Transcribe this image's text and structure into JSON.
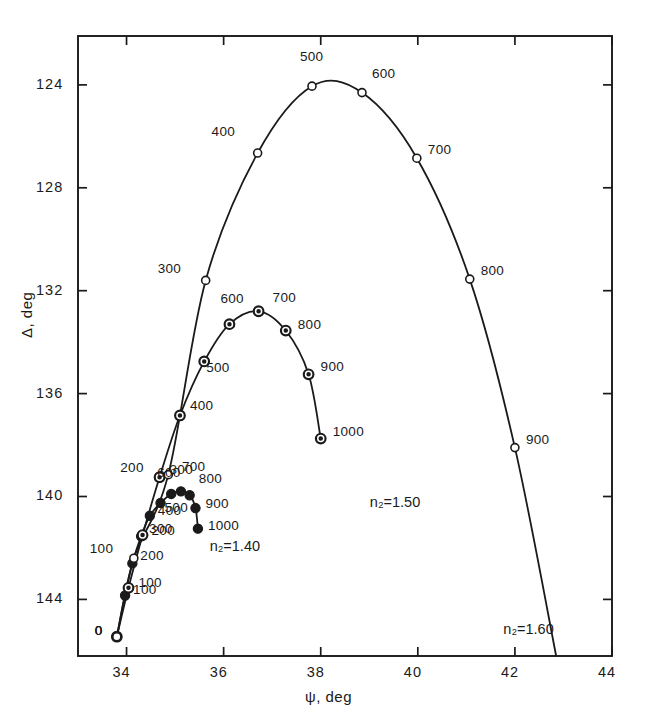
{
  "chart_data": {
    "type": "line",
    "title": "",
    "xlabel": "ψ, deg",
    "ylabel": "Δ, deg",
    "xlim": [
      33.0,
      44.0
    ],
    "ylim": [
      146.2,
      122.1
    ],
    "y_inverted": true,
    "grid": false,
    "legend_position": "inline-annotations",
    "x_ticks": [
      "34",
      "36",
      "38",
      "40",
      "42",
      "44"
    ],
    "x_tick_values": [
      34,
      36,
      38,
      40,
      42,
      44
    ],
    "y_ticks": [
      "124",
      "128",
      "132",
      "136",
      "140",
      "144"
    ],
    "y_tick_values": [
      124,
      128,
      132,
      136,
      140,
      144
    ],
    "point_label_units": "angstroms",
    "series": [
      {
        "name": "n2=1.40",
        "label": "n₂=1.40",
        "marker": "filled-circle",
        "label_x": 36.0,
        "label_y": 141.95,
        "points": [
          {
            "label": "0",
            "x": 33.8,
            "y": 145.45
          },
          {
            "label": "100",
            "x": 33.97,
            "y": 143.85
          },
          {
            "label": "200",
            "x": 34.12,
            "y": 142.6
          },
          {
            "label": "300",
            "x": 34.3,
            "y": 141.55
          },
          {
            "label": "400",
            "x": 34.48,
            "y": 140.75
          },
          {
            "label": "500",
            "x": 34.7,
            "y": 140.25
          },
          {
            "label": "600",
            "x": 34.92,
            "y": 139.9
          },
          {
            "label": "700",
            "x": 35.12,
            "y": 139.8
          },
          {
            "label": "800",
            "x": 35.3,
            "y": 139.95
          },
          {
            "label": "900",
            "x": 35.42,
            "y": 140.45
          },
          {
            "label": "1000",
            "x": 35.47,
            "y": 141.25
          }
        ]
      },
      {
        "name": "n2=1.50",
        "label": "n₂=1.50",
        "marker": "half-filled-circle",
        "label_x": 39.3,
        "label_y": 140.25,
        "points": [
          {
            "label": "0",
            "x": 33.8,
            "y": 145.45
          },
          {
            "label": "100",
            "x": 34.04,
            "y": 143.55
          },
          {
            "label": "200",
            "x": 34.33,
            "y": 141.5
          },
          {
            "label": "300",
            "x": 34.68,
            "y": 139.25
          },
          {
            "label": "400",
            "x": 35.1,
            "y": 136.85
          },
          {
            "label": "500",
            "x": 35.6,
            "y": 134.75
          },
          {
            "label": "600",
            "x": 36.12,
            "y": 133.3
          },
          {
            "label": "700",
            "x": 36.72,
            "y": 132.8
          },
          {
            "label": "800",
            "x": 37.28,
            "y": 133.55
          },
          {
            "label": "900",
            "x": 37.75,
            "y": 135.25
          },
          {
            "label": "1000",
            "x": 38.0,
            "y": 137.75
          }
        ]
      },
      {
        "name": "n2=1.60",
        "label": "n₂=1.60",
        "marker": "open-circle",
        "label_x": 42.05,
        "label_y": 145.2,
        "points": [
          {
            "label": "0",
            "x": 33.8,
            "y": 145.45
          },
          {
            "label": "100",
            "x": 34.15,
            "y": 142.4
          },
          {
            "label": "200",
            "x": 34.86,
            "y": 139.15
          },
          {
            "label": "300",
            "x": 35.63,
            "y": 131.6
          },
          {
            "label": "400",
            "x": 36.7,
            "y": 126.65
          },
          {
            "label": "500",
            "x": 37.82,
            "y": 124.05
          },
          {
            "label": "600",
            "x": 38.85,
            "y": 124.3
          },
          {
            "label": "700",
            "x": 39.98,
            "y": 126.85
          },
          {
            "label": "800",
            "x": 41.07,
            "y": 131.55
          },
          {
            "label": "900",
            "x": 42.0,
            "y": 138.1
          },
          {
            "label": "end",
            "x": 42.85,
            "y": 146.2
          }
        ]
      }
    ],
    "point_labels": [
      {
        "series": "n2=1.60",
        "text": "0",
        "x": 107,
        "y": 613,
        "anchor": "left"
      },
      {
        "series": "n2=1.60",
        "text": "100",
        "x": 126,
        "y": 556,
        "anchor": "left"
      },
      {
        "series": "n2=1.60",
        "text": "200",
        "x": 126,
        "y": 518,
        "anchor": "left"
      },
      {
        "series": "n2=1.60",
        "text": "300",
        "x": 126,
        "y": 480,
        "anchor": "left"
      },
      {
        "series": "n2=1.60",
        "text": "400",
        "x": 148,
        "y": 487,
        "anchor": "left"
      },
      {
        "series": "n2=1.60",
        "text": "500",
        "x": 148,
        "y": 506,
        "anchor": "left"
      },
      {
        "series": "n2=1.60",
        "text": "600",
        "x": 124,
        "y": 469,
        "anchor": "left"
      },
      {
        "series": "n2=1.60",
        "text": "700",
        "x": 165,
        "y": 465,
        "anchor": "left"
      },
      {
        "series": "n2=1.60",
        "text": "800",
        "x": 180,
        "y": 479,
        "anchor": "left"
      },
      {
        "series": "n2=1.60",
        "text": "900",
        "x": 186,
        "y": 500,
        "anchor": "left"
      },
      {
        "series": "n2=1.60",
        "text": "1000",
        "x": 190,
        "y": 515,
        "anchor": "left"
      }
    ]
  },
  "plot_geometry": {
    "left": 78,
    "right": 612,
    "top": 36,
    "bottom": 656
  },
  "labels": {
    "x_axis": "ψ, deg",
    "y_axis": "Δ, deg"
  }
}
